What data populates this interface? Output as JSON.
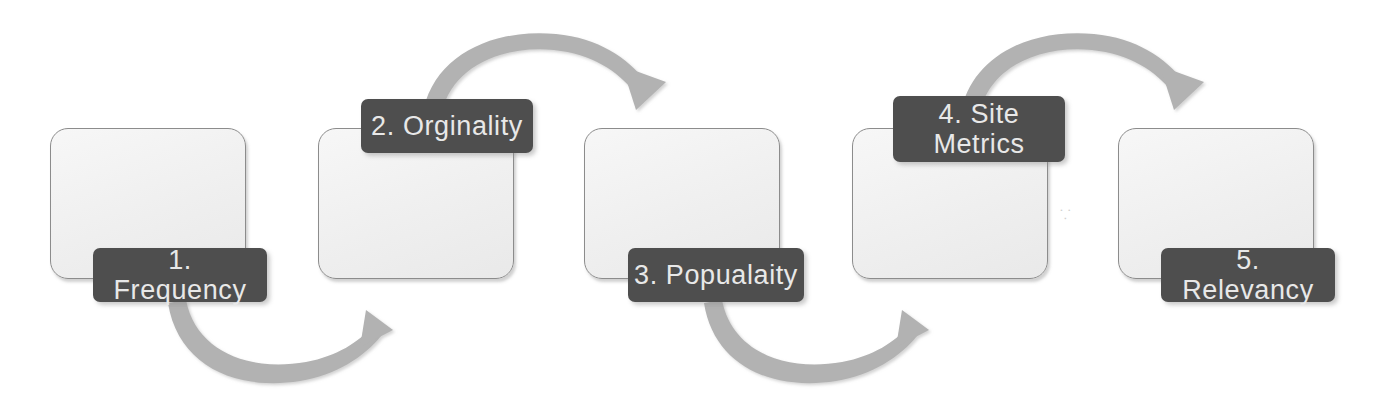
{
  "diagram": {
    "type": "process-flow",
    "title": "",
    "orientation": "horizontal-zigzag",
    "colors": {
      "label_background": "#4e4e4e",
      "label_text": "#e8e8e8",
      "box_fill": "#efefef",
      "box_border": "#8c8c8c",
      "arrow": "#b0b0b0",
      "page_background": "#ffffff"
    },
    "steps": [
      {
        "number": "1",
        "label": "1. Frequency",
        "label_position": "bottom-right",
        "box": {
          "x": 50,
          "y": 128,
          "w": 194,
          "h": 149
        },
        "tag": {
          "x": 93,
          "y": 248,
          "w": 174,
          "h": 54
        }
      },
      {
        "number": "2",
        "label": "2. Orginality",
        "label_position": "top-right",
        "box": {
          "x": 318,
          "y": 128,
          "w": 194,
          "h": 149
        },
        "tag": {
          "x": 361,
          "y": 99,
          "w": 172,
          "h": 54
        }
      },
      {
        "number": "3",
        "label": "3. Popualaity",
        "label_position": "bottom-right",
        "box": {
          "x": 584,
          "y": 128,
          "w": 194,
          "h": 149
        },
        "tag": {
          "x": 628,
          "y": 248,
          "w": 176,
          "h": 54
        }
      },
      {
        "number": "4",
        "label": "4. Site\nMetrics",
        "label_position": "top-right",
        "box": {
          "x": 852,
          "y": 128,
          "w": 194,
          "h": 149
        },
        "tag": {
          "x": 893,
          "y": 96,
          "w": 172,
          "h": 66
        }
      },
      {
        "number": "5",
        "label": "5. Relevancy",
        "label_position": "bottom-right",
        "box": {
          "x": 1118,
          "y": 128,
          "w": 194,
          "h": 149
        },
        "tag": {
          "x": 1161,
          "y": 248,
          "w": 174,
          "h": 54
        }
      }
    ],
    "arrows": [
      {
        "name": "arrow-step1-to-step2",
        "direction": "down-curve",
        "from_step": 1,
        "to_step": 2
      },
      {
        "name": "arrow-step2-to-step3",
        "direction": "up-curve",
        "from_step": 2,
        "to_step": 3
      },
      {
        "name": "arrow-step3-to-step4",
        "direction": "down-curve",
        "from_step": 3,
        "to_step": 4
      },
      {
        "name": "arrow-step4-to-step5",
        "direction": "up-curve",
        "from_step": 4,
        "to_step": 5
      }
    ],
    "artifact_mark": "⸪"
  }
}
